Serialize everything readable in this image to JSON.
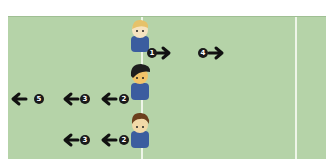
{
  "diagram": {
    "type": "movement-play",
    "field_color": "#b5d3a8",
    "players": [
      {
        "name": "blonde-player",
        "hair": "#e6c26a",
        "shirt": "#3b5d9f",
        "moves": [
          {
            "step": "1",
            "direction": "right"
          },
          {
            "step": "4",
            "direction": "right"
          }
        ]
      },
      {
        "name": "dark-hair-player",
        "hair": "#1e1e1e",
        "shirt": "#3b5d9f",
        "moves": [
          {
            "step": "2",
            "direction": "left"
          },
          {
            "step": "3",
            "direction": "left"
          },
          {
            "step": "5",
            "direction": "left"
          }
        ]
      },
      {
        "name": "brown-hair-player",
        "hair": "#6b3f1d",
        "shirt": "#3b5d9f",
        "moves": [
          {
            "step": "2",
            "direction": "left"
          },
          {
            "step": "3",
            "direction": "left"
          }
        ]
      }
    ]
  }
}
